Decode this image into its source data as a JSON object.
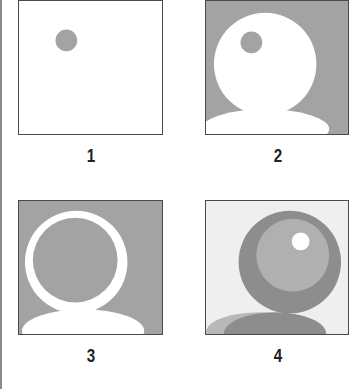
{
  "figure": {
    "panels": [
      {
        "label": "1",
        "description": "White square with small gray dot",
        "background": "#ffffff"
      },
      {
        "label": "2",
        "description": "Gray square with white circle head and shoulders, small gray dot",
        "background": "#a3a3a3"
      },
      {
        "label": "3",
        "description": "Gray square with white ring head outline and white shoulders",
        "background": "#a3a3a3"
      },
      {
        "label": "4",
        "description": "Light square with dark gray ring, mid-gray inner circle, white highlight dot and gray shoulders",
        "background": "#efefef"
      }
    ],
    "colors": {
      "gray": "#a3a3a3",
      "dark_gray": "#8d8d8d",
      "mid_gray": "#b0b0b0",
      "light_bg": "#efefef",
      "white": "#ffffff",
      "border": "#4a4a4a"
    }
  }
}
